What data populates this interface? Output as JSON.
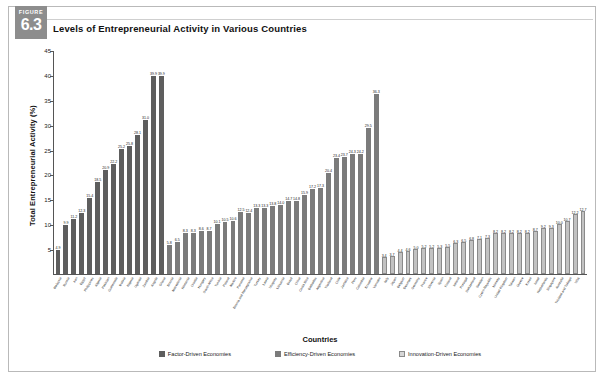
{
  "figure": {
    "badge_word": "FIGURE",
    "badge_number": "6.3",
    "title": "Levels of Entrepreneurial Activity in Various Countries"
  },
  "legend": {
    "items": [
      {
        "label": "Factor-Driven Economies",
        "key": "factor",
        "color": "#5e5e5e"
      },
      {
        "label": "Efficiency-Driven Economies",
        "key": "efficiency",
        "color": "#7b7b7b"
      },
      {
        "label": "Innovation-Driven Economies",
        "key": "innovation",
        "color": "#d6d6d6"
      }
    ]
  },
  "chart_data": {
    "type": "bar",
    "title": "Levels of Entrepreneurial Activity in Various Countries",
    "xlabel": "Countries",
    "ylabel": "Total Entrepreneurial Activity (%)",
    "ylim": [
      0,
      45
    ],
    "ytick_step": 5,
    "yticks": [
      5,
      10,
      15,
      20,
      25,
      30,
      35,
      40,
      45
    ],
    "grid": false,
    "legend_position": "bottom-center",
    "series": [
      {
        "name": "Factor-Driven Economies",
        "color": "#5e5e5e",
        "categories": [
          "Malaysia",
          "Russia",
          "Iran",
          "Egypt",
          "Philippines",
          "Algeria",
          "Pakistan",
          "Guatemala",
          "Bolivia",
          "Nigeria",
          "Uganda",
          "Zambia",
          "Angola",
          "Ghana"
        ],
        "values": [
          4.9,
          9.9,
          11.2,
          12.3,
          15.4,
          18.5,
          20.9,
          22.2,
          25.2,
          25.8,
          28.1,
          31.0,
          39.9,
          39.9
        ]
      },
      {
        "name": "Efficiency-Driven Economies",
        "color": "#7b7b7b",
        "categories": [
          "Bosnia",
          "Macedonia",
          "Romania",
          "Croatia",
          "Hungary",
          "South Africa",
          "Tunisia",
          "Poland",
          "Mexico",
          "Panama",
          "Bosnia and Herzegovina",
          "Turkey",
          "Latvia",
          "Uruguay",
          "Lithuania",
          "Brazil",
          "China",
          "Costa Rica",
          "Barbados",
          "Argentina",
          "Thailand",
          "Chile",
          "Jamaica",
          "Peru",
          "Colombia",
          "Ecuador",
          "Vanuatu"
        ],
        "values": [
          5.8,
          6.5,
          8.3,
          8.3,
          8.6,
          8.7,
          10.1,
          10.5,
          10.6,
          12.5,
          12.4,
          13.3,
          13.3,
          13.8,
          14.0,
          14.7,
          14.8,
          15.9,
          17.2,
          17.3,
          20.4,
          23.4,
          23.7,
          24.3,
          24.2,
          29.5,
          36.3
        ]
      },
      {
        "name": "Innovation-Driven Economies",
        "color": "#d6d6d6",
        "categories": [
          "Italy",
          "Japan",
          "Belgium",
          "Denmark",
          "Germany",
          "France",
          "Slovenia",
          "Spain",
          "Finland",
          "Ireland",
          "Portugal",
          "Switzerland",
          "Sweden",
          "Czech Republic",
          "Norway",
          "United Kingdom",
          "Taiwan",
          "Greece",
          "Korea",
          "Israel",
          "Netherlands",
          "Singapore",
          "Australia",
          "Trinidad and Tobago",
          "USA"
        ],
        "values": [
          3.4,
          3.7,
          4.4,
          4.6,
          5.0,
          5.2,
          5.2,
          5.3,
          5.5,
          6.3,
          6.5,
          6.8,
          7.1,
          7.3,
          8.2,
          8.2,
          8.2,
          8.2,
          8.2,
          8.7,
          9.2,
          9.3,
          10.0,
          10.7,
          12.2,
          12.7
        ]
      }
    ]
  }
}
